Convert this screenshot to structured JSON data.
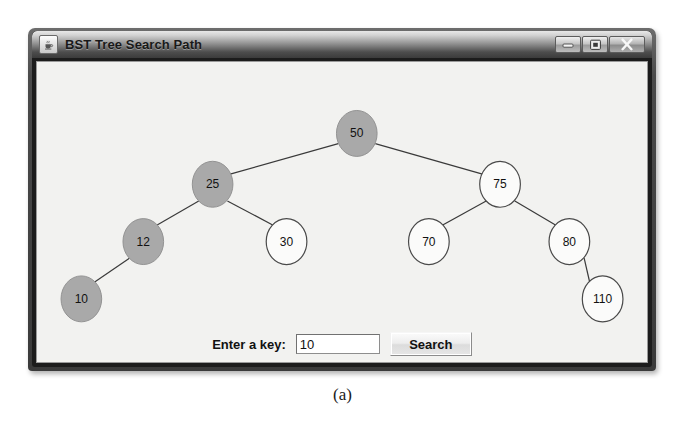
{
  "window": {
    "title": "BST Tree Search Path",
    "app_icon": "java-coffee-cup-icon",
    "controls": {
      "minimize": "minimize-icon",
      "maximize": "maximize-icon",
      "close": "close-icon"
    }
  },
  "controls": {
    "key_label": "Enter a key:",
    "key_value": "10",
    "key_placeholder": "",
    "search_label": "Search"
  },
  "caption": "(a)",
  "colors": {
    "highlight_fill": "#a9a9a9",
    "node_fill": "#fbfbfa",
    "node_stroke": "#4a4a4a",
    "edge_stroke": "#3a3a3a",
    "panel_bg": "#f2f2f0"
  },
  "chart_data": {
    "type": "diagram",
    "title": "BST Tree Search Path",
    "search_key": "10",
    "search_path": [
      50,
      25,
      12,
      10
    ],
    "nodes": [
      {
        "id": "n50",
        "value": "50",
        "cx": 346,
        "cy": 55,
        "r": 22,
        "highlighted": true
      },
      {
        "id": "n25",
        "value": "25",
        "cx": 190,
        "cy": 110,
        "r": 22,
        "highlighted": true
      },
      {
        "id": "n75",
        "value": "75",
        "cx": 501,
        "cy": 110,
        "r": 22,
        "highlighted": false
      },
      {
        "id": "n12",
        "value": "12",
        "cx": 115,
        "cy": 172,
        "r": 22,
        "highlighted": true
      },
      {
        "id": "n30",
        "value": "30",
        "cx": 270,
        "cy": 172,
        "r": 22,
        "highlighted": false
      },
      {
        "id": "n70",
        "value": "70",
        "cx": 424,
        "cy": 172,
        "r": 22,
        "highlighted": false
      },
      {
        "id": "n80",
        "value": "80",
        "cx": 576,
        "cy": 172,
        "r": 22,
        "highlighted": false
      },
      {
        "id": "n10",
        "value": "10",
        "cx": 48,
        "cy": 234,
        "r": 22,
        "highlighted": true
      },
      {
        "id": "n110",
        "value": "110",
        "cx": 612,
        "cy": 234,
        "r": 22,
        "highlighted": false
      }
    ],
    "edges": [
      {
        "from": "n50",
        "to": "n25",
        "x1": 326,
        "y1": 66,
        "x2": 209,
        "y2": 99
      },
      {
        "from": "n50",
        "to": "n75",
        "x1": 366,
        "y1": 66,
        "x2": 482,
        "y2": 99
      },
      {
        "from": "n25",
        "to": "n12",
        "x1": 175,
        "y1": 128,
        "x2": 130,
        "y2": 154
      },
      {
        "from": "n25",
        "to": "n30",
        "x1": 206,
        "y1": 128,
        "x2": 255,
        "y2": 154
      },
      {
        "from": "n75",
        "to": "n70",
        "x1": 486,
        "y1": 128,
        "x2": 439,
        "y2": 154
      },
      {
        "from": "n75",
        "to": "n80",
        "x1": 517,
        "y1": 128,
        "x2": 561,
        "y2": 154
      },
      {
        "from": "n12",
        "to": "n10",
        "x1": 100,
        "y1": 190,
        "x2": 62,
        "y2": 216
      },
      {
        "from": "n80",
        "to": "n110",
        "x1": 592,
        "y1": 190,
        "x2": 598,
        "y2": 216
      }
    ]
  }
}
